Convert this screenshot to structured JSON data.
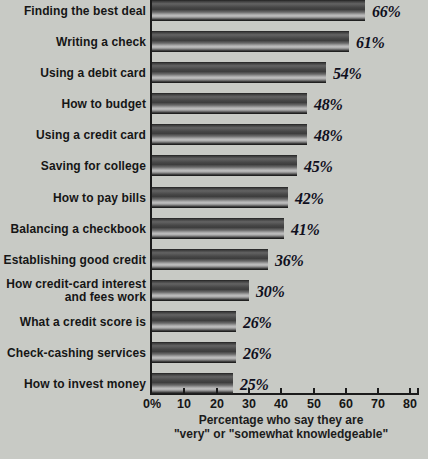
{
  "chart_data": {
    "type": "bar",
    "orientation": "horizontal",
    "categories": [
      "Finding the best deal",
      "Writing a check",
      "Using a debit card",
      "How to budget",
      "Using a credit card",
      "Saving for college",
      "How to pay bills",
      "Balancing a checkbook",
      "Establishing good credit",
      "How credit-card interest\nand fees work",
      "What a credit score is",
      "Check-cashing services",
      "How to invest money"
    ],
    "values": [
      66,
      61,
      54,
      48,
      48,
      45,
      42,
      41,
      36,
      30,
      26,
      26,
      25
    ],
    "value_labels": [
      "66%",
      "61%",
      "54%",
      "48%",
      "48%",
      "45%",
      "42%",
      "41%",
      "36%",
      "30%",
      "26%",
      "26%",
      "25%"
    ],
    "xlabel": "Percentage who say they are \"very\" or \"somewhat knowledgeable\"",
    "xlabel_lines": [
      "Percentage who say they are",
      "\"very\" or \"somewhat knowledgeable\""
    ],
    "xlim": [
      0,
      80
    ],
    "xtick_values": [
      0,
      10,
      20,
      30,
      40,
      50,
      60,
      70,
      80
    ],
    "xtick_labels": [
      "0%",
      "10",
      "20",
      "30",
      "40",
      "50",
      "60",
      "70",
      "80"
    ],
    "grid": false,
    "legend": null,
    "colors": {
      "background": "#c8cac5",
      "axis": "#1b1b1b",
      "category_text": "#161616",
      "value_text": "#10101e",
      "bar_dark": "#1c1c1c",
      "bar_highlight": "#c2c2c2"
    }
  }
}
